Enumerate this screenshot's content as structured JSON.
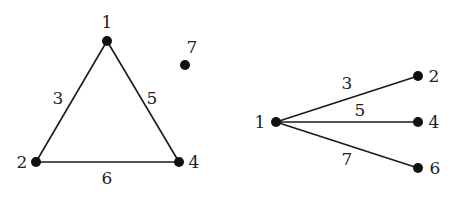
{
  "graphs": [
    {
      "name": "triangle-graph",
      "nodes": [
        {
          "id": "1",
          "label": "1",
          "x": 107,
          "y": 41,
          "lx": 107,
          "ly": 28,
          "anchor": "middle"
        },
        {
          "id": "2",
          "label": "2",
          "x": 36,
          "y": 162,
          "lx": 22,
          "ly": 168,
          "anchor": "middle"
        },
        {
          "id": "4",
          "label": "4",
          "x": 179,
          "y": 162,
          "lx": 194,
          "ly": 168,
          "anchor": "middle"
        },
        {
          "id": "7",
          "label": "7",
          "x": 185,
          "y": 65,
          "lx": 192,
          "ly": 53,
          "anchor": "middle"
        }
      ],
      "edges": [
        {
          "from": "1",
          "to": "2",
          "label": "3",
          "lx": 58,
          "ly": 104
        },
        {
          "from": "1",
          "to": "4",
          "label": "5",
          "lx": 152,
          "ly": 104
        },
        {
          "from": "2",
          "to": "4",
          "label": "6",
          "lx": 107,
          "ly": 184
        }
      ]
    },
    {
      "name": "star-graph",
      "nodes": [
        {
          "id": "1",
          "label": "1",
          "x": 276,
          "y": 122,
          "lx": 260,
          "ly": 128,
          "anchor": "middle"
        },
        {
          "id": "2",
          "label": "2",
          "x": 418,
          "y": 76,
          "lx": 434,
          "ly": 82,
          "anchor": "middle"
        },
        {
          "id": "4",
          "label": "4",
          "x": 418,
          "y": 122,
          "lx": 434,
          "ly": 128,
          "anchor": "middle"
        },
        {
          "id": "6",
          "label": "6",
          "x": 418,
          "y": 168,
          "lx": 435,
          "ly": 174,
          "anchor": "middle"
        }
      ],
      "edges": [
        {
          "from": "1",
          "to": "2",
          "label": "3",
          "lx": 347,
          "ly": 89
        },
        {
          "from": "1",
          "to": "4",
          "label": "5",
          "lx": 360,
          "ly": 116
        },
        {
          "from": "1",
          "to": "6",
          "label": "7",
          "lx": 347,
          "ly": 165
        }
      ]
    }
  ]
}
